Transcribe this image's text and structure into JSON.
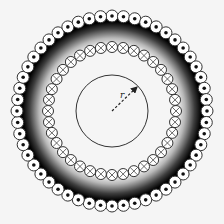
{
  "diagram": {
    "type": "coaxial-solenoid-cross-section",
    "center": [
      112,
      111
    ],
    "outer_ring": {
      "radius": 95,
      "count": 52,
      "wire_radius": 6,
      "current_direction": "out-of-page",
      "symbol": "dot"
    },
    "inner_ring": {
      "radius": 64,
      "count": 36,
      "wire_radius": 5.5,
      "current_direction": "into-page",
      "symbol": "cross"
    },
    "amperian_loop": {
      "radius": 36
    },
    "radius_arrow": {
      "label": "r",
      "end": [
        137,
        87
      ]
    },
    "field_region": {
      "inner_radius": 66,
      "outer_radius": 93,
      "color": "#000000"
    },
    "colors": {
      "background": "#f5f5f5",
      "stroke": "#333333",
      "wire_fill": "#ffffff"
    }
  }
}
